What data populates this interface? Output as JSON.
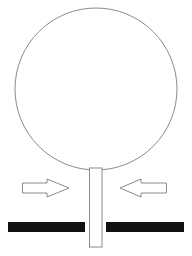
{
  "diagram": {
    "colors": {
      "background": "#ffffff",
      "outline": "#8a8a8a",
      "plate": "#111111"
    },
    "elements": {
      "circle": {
        "cx": 96,
        "cy": 89,
        "r": 81
      },
      "stem": {
        "x": 89.5,
        "y": 168,
        "w": 12.5,
        "h": 79
      },
      "arrow_left": {
        "direction": "right",
        "x1": 22,
        "x2": 69
      },
      "arrow_right": {
        "direction": "left",
        "x1": 120,
        "x2": 167
      },
      "plate_left": {
        "x": 8,
        "y": 222,
        "w": 77,
        "h": 10
      },
      "plate_right": {
        "x": 106,
        "y": 222,
        "w": 78,
        "h": 10
      }
    }
  }
}
